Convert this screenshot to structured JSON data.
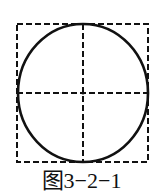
{
  "figure": {
    "caption": "图3−2−1",
    "square": {
      "x": 17,
      "y": 24,
      "width": 131,
      "height": 138,
      "style": "dashed"
    },
    "circle": {
      "cx": 83,
      "cy": 93,
      "rx": 65,
      "ry": 69,
      "style": "solid"
    },
    "centerlines": {
      "horizontal_y": 93,
      "vertical_x": 83,
      "style": "dashed"
    },
    "colors": {
      "stroke": "#111111",
      "background": "#ffffff"
    }
  }
}
